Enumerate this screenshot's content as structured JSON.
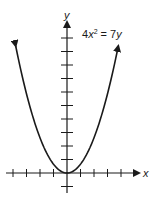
{
  "chart_data": {
    "type": "line",
    "title": "",
    "equation": "4x² = 7y",
    "equation_parts": {
      "lhs_coef": "4",
      "lhs_var": "x",
      "lhs_exp": "2",
      "eq": " = ",
      "rhs_coef": "7",
      "rhs_var": "y"
    },
    "xlabel": "x",
    "ylabel": "y",
    "grid": false,
    "legend": null,
    "x_ticks_left": 4,
    "x_ticks_right": 4,
    "y_ticks_up": 10,
    "y_ticks_down": 1,
    "series": [
      {
        "name": "4x² = 7y",
        "function": "y = 4x²/7",
        "x": [
          -3.8,
          -3,
          -2,
          -1,
          0,
          1,
          2,
          3,
          3.8
        ],
        "y": [
          8.25,
          5.14,
          2.29,
          0.57,
          0,
          0.57,
          2.29,
          5.14,
          8.25
        ],
        "arrows_at_ends": true
      }
    ]
  },
  "labels": {
    "x_axis": "x",
    "y_axis": "y",
    "equation_coef": "4",
    "equation_var": "x",
    "equation_exp": "2",
    "equation_rest": " = 7",
    "equation_rhs_var": "y"
  }
}
